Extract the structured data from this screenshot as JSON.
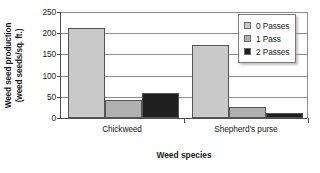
{
  "chart_data": {
    "type": "bar",
    "title": "",
    "xlabel": "Weed species",
    "ylabel_line1": "Weed seed production",
    "ylabel_line2": "(weed seeds/sq. ft.)",
    "categories": [
      "Chickweed",
      "Shepherd’s purse"
    ],
    "series": [
      {
        "name": "0 Passes",
        "values": [
          213,
          173
        ],
        "color": "#c9c9c9"
      },
      {
        "name": "1 Pass",
        "values": [
          43,
          25
        ],
        "color": "#b0b0b0"
      },
      {
        "name": "2 Passes",
        "values": [
          58,
          12
        ],
        "color": "#1f1f1f"
      }
    ],
    "ylim": [
      0,
      250
    ],
    "yticks": [
      0,
      50,
      100,
      150,
      200,
      250
    ],
    "ytick_labels": [
      "0",
      "50",
      "100",
      "150",
      "200",
      "250"
    ],
    "grid": true,
    "legend_position": "top-right"
  },
  "legend": {
    "items": [
      {
        "label": "0 Passes"
      },
      {
        "label": "1 Pass"
      },
      {
        "label": "2 Passes"
      }
    ]
  },
  "axes": {
    "x_title": "Weed species",
    "y_title_line1": "Weed seed production",
    "y_title_line2": "(weed seeds/sq. ft.)"
  }
}
